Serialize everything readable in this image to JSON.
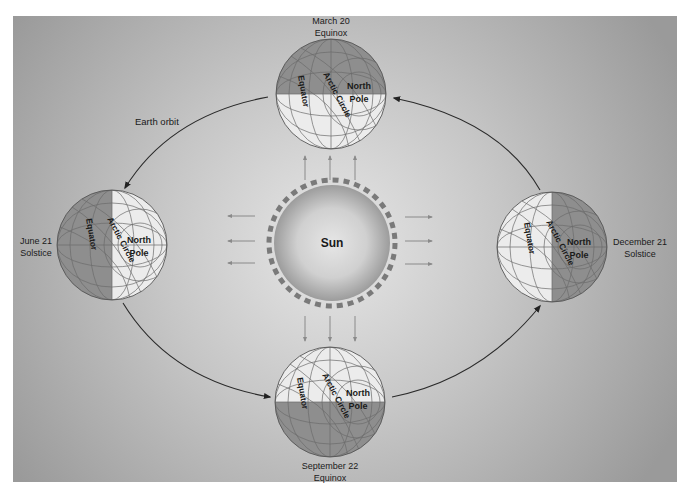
{
  "diagram": {
    "background": {
      "edge_color": "#9a9a9a",
      "center_color": "#e4e4e4",
      "margin_color": "#ffffff"
    },
    "sun": {
      "label": "Sun",
      "color_center": "#e2e2e2",
      "color_edge": "#9a9a9a",
      "flare_color": "#7a7a7a"
    },
    "orbit_label": "Earth orbit",
    "globe_labels": {
      "equator": "Equator",
      "arctic_circle": "Arctic Circle",
      "north": "North",
      "pole": "Pole"
    },
    "positions": [
      {
        "id": "march",
        "date": "March 20",
        "event": "Equinox",
        "lit": "bottom-half"
      },
      {
        "id": "june",
        "date": "June 21",
        "event": "Solstice",
        "lit": "right-half"
      },
      {
        "id": "september",
        "date": "September 22",
        "event": "Equinox",
        "lit": "top-half"
      },
      {
        "id": "december",
        "date": "December 21",
        "event": "Solstice",
        "lit": "left-half"
      }
    ],
    "colors": {
      "globe_dark": "#8e8e8e",
      "globe_light": "#ececec",
      "grid_line": "#6c6c6c",
      "orbit_line": "#2a2a2a",
      "ray_arrow": "#8a8a8a"
    }
  }
}
